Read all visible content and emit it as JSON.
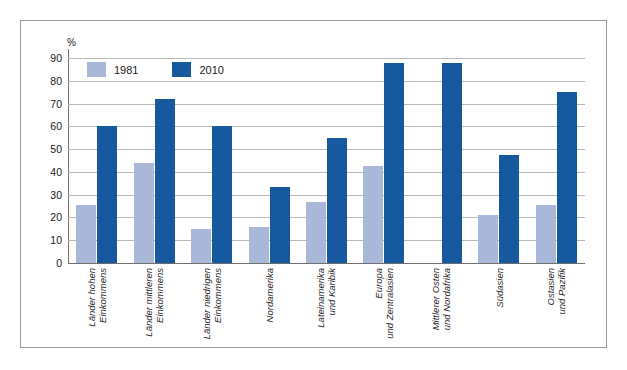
{
  "chart_data": {
    "type": "bar",
    "title": "",
    "subtitle": "",
    "xlabel": "",
    "ylabel": "%",
    "unit_label": "%",
    "ylim": [
      0,
      90
    ],
    "ytick_step": 10,
    "yticks": [
      90,
      80,
      70,
      60,
      50,
      40,
      30,
      20,
      10,
      0
    ],
    "grid": true,
    "legend_position": "top-left-inside",
    "categories": [
      "Länder hohen Einkommens",
      "Länder mittleren Einkommens",
      "Länder niedrigen Einkommens",
      "Nordamerika",
      "Lateinamerika und Karibik",
      "Europa und Zentralasien",
      "Mittlerer Osten und Nordafrika",
      "Südasien",
      "Ostasien und Pazifik"
    ],
    "categories_lines": [
      [
        "Länder hohen",
        "Einkommens"
      ],
      [
        "Länder mittleren",
        "Einkommens"
      ],
      [
        "Länder niedrigen",
        "Einkommens"
      ],
      [
        "Nordamerika",
        ""
      ],
      [
        "Lateinamerika",
        "und Karibik"
      ],
      [
        "Europa",
        "und Zentralasien"
      ],
      [
        "Mittlerer Osten",
        "und Nordafrika"
      ],
      [
        "Südasien",
        ""
      ],
      [
        "Ostasien",
        "und Pazifik"
      ]
    ],
    "series": [
      {
        "name": "1981",
        "color": "#a9b8d9",
        "values": [
          25.5,
          44,
          15,
          16,
          27,
          42.5,
          0,
          21,
          25.5
        ]
      },
      {
        "name": "2010",
        "color": "#17599e",
        "values": [
          60,
          72,
          60,
          33.5,
          55,
          88,
          88,
          47.5,
          75
        ]
      }
    ]
  },
  "legend": {
    "items": [
      {
        "label": "1981",
        "color": "#a9b8d9"
      },
      {
        "label": "2010",
        "color": "#17599e"
      }
    ]
  },
  "colors": {
    "series_1981": "#a9b8d9",
    "series_2010": "#17599e",
    "gridline": "#b9b9b9",
    "axis": "#6f6f6f",
    "frame": "#9a9a9a",
    "background": "#ffffff"
  }
}
